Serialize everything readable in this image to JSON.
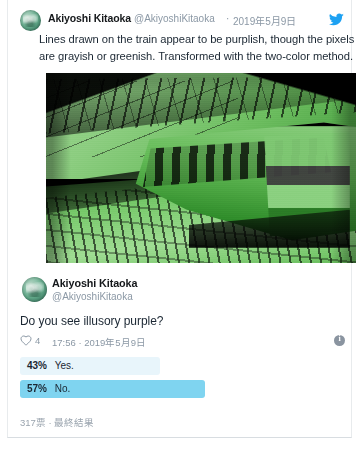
{
  "card": {
    "tweet_main": {
      "avatar_name": "avatar-akiyoshi-kitaoka",
      "display_name": "Akiyoshi Kitaoka",
      "handle": "@AkiyoshiKitaoka",
      "separator": "·",
      "date": "2019年5月9日",
      "body": "Lines drawn on the train appear to be purplish, though the pixels are grayish or greenish. Transformed with the two-color method.",
      "brand_icon": "twitter-bird-icon",
      "media": {
        "name": "train-photo-green-duotone",
        "description": "Green two-color duotone photograph of a train at a station platform"
      }
    },
    "tweet_poll": {
      "display_name": "Akiyoshi Kitaoka",
      "handle": "@AkiyoshiKitaoka",
      "question": "Do you see illusory purple?",
      "meta": {
        "like_icon": "heart-icon",
        "like_count": "4",
        "timestamp": "17:56 · 2019年5月9日",
        "info_icon": "info-icon"
      },
      "poll": {
        "options": [
          {
            "percent_label": "43%",
            "percent_value": 43,
            "choice": "Yes."
          },
          {
            "percent_label": "57%",
            "percent_value": 57,
            "choice": "No."
          }
        ],
        "footer": "317票 · 最終結果"
      }
    }
  },
  "colors": {
    "brand_blue": "#1da1f2",
    "poll_bar_active": "#7fd4f0",
    "poll_bar_inactive": "#e8f5fb",
    "text_primary": "#1b2733",
    "text_muted": "#8b98a5",
    "card_border": "#e8ebed"
  }
}
